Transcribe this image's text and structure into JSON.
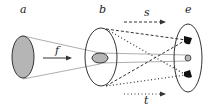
{
  "labels": {
    "a": "a",
    "b": "b",
    "e": "e",
    "f": "f",
    "s": "s",
    "t": "t"
  },
  "colors": {
    "stroke": "#333333",
    "fill_gray": "#b5b5b5",
    "beam": "#999999",
    "dot_black": "#111111"
  },
  "nodes": [
    {
      "id": "a",
      "shape": "filled-ellipse"
    },
    {
      "id": "b",
      "shape": "ellipse-with-inner-ellipse"
    },
    {
      "id": "e",
      "shape": "ellipse-with-three-dots"
    }
  ],
  "edges": [
    {
      "from": "a",
      "to": "b",
      "label": "f",
      "style": "solid-arrow"
    },
    {
      "label": "s",
      "style": "dashed-arrow"
    },
    {
      "label": "t",
      "style": "dotted-arrow"
    }
  ]
}
